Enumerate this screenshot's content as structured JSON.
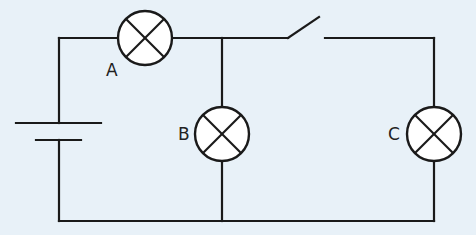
{
  "diagram": {
    "type": "circuit",
    "background_color": "#e8f1f8",
    "line_color": "#1a1a1a",
    "components": [
      {
        "id": "battery",
        "kind": "cell"
      },
      {
        "id": "lamp-a",
        "kind": "lamp",
        "label": "A"
      },
      {
        "id": "lamp-b",
        "kind": "lamp",
        "label": "B"
      },
      {
        "id": "lamp-c",
        "kind": "lamp",
        "label": "C"
      },
      {
        "id": "switch",
        "kind": "switch",
        "state": "open"
      }
    ],
    "labels": {
      "a": "A",
      "b": "B",
      "c": "C"
    }
  }
}
